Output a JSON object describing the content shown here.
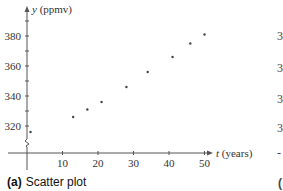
{
  "chart_data": {
    "type": "scatter",
    "title": "",
    "caption_label": "(a)",
    "caption_text": "Scatter plot",
    "xlabel_var": "t",
    "xlabel_unit": "(years)",
    "ylabel_var": "y",
    "ylabel_unit": "(ppmv)",
    "x": [
      1,
      13,
      17,
      21,
      28,
      34,
      41,
      46,
      50
    ],
    "y": [
      316,
      326,
      331,
      336,
      346,
      356,
      366,
      375,
      381
    ],
    "xticks": [
      10,
      20,
      30,
      40,
      50
    ],
    "yticks": [
      320,
      340,
      360,
      380
    ],
    "xlim": [
      0,
      52
    ],
    "ylim": [
      305,
      390
    ],
    "y_axis_break": true,
    "grid": false,
    "legend": null
  },
  "right_panel_partial": {
    "tick_fragments": [
      "3",
      "3",
      "3",
      "3",
      "-"
    ],
    "caption_fragment": "("
  }
}
